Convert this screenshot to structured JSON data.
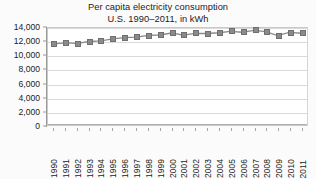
{
  "chart_data": {
    "type": "line",
    "title": "Per capita electricity consumption",
    "subtitle": "U.S. 1990–2011, in kWh",
    "xlabel": "",
    "ylabel": "",
    "ylim": [
      0,
      14000
    ],
    "ytick_step": 2000,
    "grid": true,
    "legend": "none",
    "marker_style": "square",
    "series_color": "#8a8a8a",
    "categories": [
      "1990",
      "1991",
      "1992",
      "1993",
      "1994",
      "1995",
      "1996",
      "1997",
      "1998",
      "1999",
      "2000",
      "2001",
      "2002",
      "2003",
      "2004",
      "2005",
      "2006",
      "2007",
      "2008",
      "2009",
      "2010",
      "2011"
    ],
    "values": [
      11713,
      11860,
      11780,
      12050,
      12150,
      12430,
      12610,
      12690,
      12930,
      12990,
      13270,
      12980,
      13230,
      13200,
      13310,
      13520,
      13390,
      13660,
      13480,
      12910,
      13360,
      13250
    ],
    "yticks": [
      "14,000",
      "12,000",
      "10,000",
      "8,000",
      "6,000",
      "4,000",
      "2,000",
      "0"
    ],
    "ytick_values": [
      14000,
      12000,
      10000,
      8000,
      6000,
      4000,
      2000,
      0
    ]
  }
}
